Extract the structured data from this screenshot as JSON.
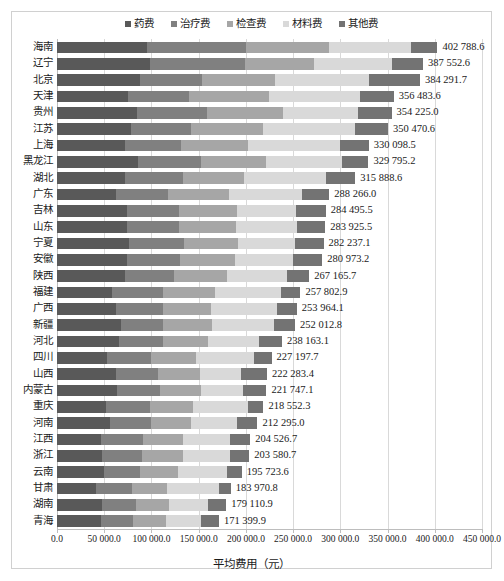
{
  "chart_data": {
    "type": "bar",
    "orientation": "horizontal",
    "stacked": true,
    "title": "",
    "xlabel": "平均费用（元）",
    "ylabel": "",
    "xlim": [
      0,
      450000
    ],
    "xticks": [
      "0.0",
      "50 000.0",
      "100 000.0",
      "150 000.0",
      "200 000.0",
      "250 000.0",
      "300 000.0",
      "350 000.0",
      "400 000.0",
      "450 000.0"
    ],
    "xtick_values": [
      0,
      50000,
      100000,
      150000,
      200000,
      250000,
      300000,
      350000,
      400000,
      450000
    ],
    "grid": true,
    "legend_position": "top",
    "legend": [
      "药费",
      "治疗费",
      "检查费",
      "材料费",
      "其他费"
    ],
    "colors": [
      "#595959",
      "#808080",
      "#a6a6a6",
      "#d9d9d9",
      "#737373"
    ],
    "categories": [
      "海南",
      "辽宁",
      "北京",
      "天津",
      "贵州",
      "江苏",
      "上海",
      "黑龙江",
      "湖北",
      "广东",
      "吉林",
      "山东",
      "宁夏",
      "安徽",
      "陕西",
      "福建",
      "广西",
      "新疆",
      "河北",
      "四川",
      "山西",
      "内蒙古",
      "重庆",
      "河南",
      "江西",
      "浙江",
      "云南",
      "甘肃",
      "湖南",
      "青海"
    ],
    "totals": [
      402788.6,
      387552.6,
      384291.7,
      356483.6,
      354225.0,
      350470.6,
      330098.5,
      329795.2,
      315888.6,
      288266.0,
      284495.5,
      283925.5,
      282237.1,
      280973.2,
      267165.7,
      257802.9,
      253964.1,
      252012.8,
      238163.1,
      227197.7,
      222283.4,
      221747.1,
      218552.3,
      212295.0,
      204526.7,
      203580.7,
      195723.6,
      183970.8,
      179110.9,
      171399.9
    ],
    "total_labels": [
      "402 788.6",
      "387 552.6",
      "384 291.7",
      "356 483.6",
      "354 225.0",
      "350 470.6",
      "330 098.5",
      "329 795.2",
      "315 888.6",
      "288 266.0",
      "284 495.5",
      "283 925.5",
      "282 237.1",
      "280 973.2",
      "267 165.7",
      "257 802.9",
      "253 964.1",
      "252 012.8",
      "238 163.1",
      "227 197.7",
      "222 283.4",
      "221 747.1",
      "218 552.3",
      "212 295.0",
      "204 526.7",
      "203 580.7",
      "195 723.6",
      "183 970.8",
      "179 110.9",
      "171 399.9"
    ],
    "series": [
      {
        "name": "药费",
        "values": [
          95000,
          99000,
          88000,
          75000,
          85000,
          78000,
          72000,
          86000,
          72000,
          62000,
          74000,
          74000,
          76000,
          74000,
          72000,
          58000,
          62000,
          68000,
          66000,
          53000,
          62000,
          63000,
          52000,
          56000,
          47000,
          48000,
          50000,
          41000,
          48000,
          47000
        ]
      },
      {
        "name": "治疗费",
        "values": [
          105000,
          100000,
          66000,
          65000,
          74000,
          64000,
          59000,
          66000,
          61000,
          56000,
          55000,
          55000,
          58000,
          56000,
          52000,
          54000,
          50000,
          44000,
          46000,
          47000,
          45000,
          46000,
          46000,
          44000,
          44000,
          42000,
          38000,
          38000,
          36000,
          34000
        ]
      },
      {
        "name": "检查费",
        "values": [
          88000,
          73000,
          77000,
          84000,
          80000,
          76000,
          71000,
          69000,
          65000,
          64000,
          62000,
          61000,
          58000,
          59000,
          56000,
          55000,
          51000,
          52000,
          48000,
          47000,
          44000,
          44000,
          46000,
          42000,
          42000,
          43000,
          40000,
          38000,
          35000,
          34000
        ]
      },
      {
        "name": "材料费",
        "values": [
          86789,
          82553,
          99292,
          96484,
          80225,
          97471,
          98099,
          80795,
          86889,
          77266,
          62496,
          63926,
          60237,
          60973,
          63166,
          69803,
          69964,
          66013,
          54163,
          61198,
          44283,
          43747,
          58552,
          48295,
          50527,
          50581,
          51724,
          54971,
          41111,
          37400
        ]
      },
      {
        "name": "其他费",
        "values": [
          28000,
          33000,
          54000,
          36000,
          35000,
          35000,
          30000,
          28000,
          31000,
          29000,
          31000,
          30000,
          30000,
          31000,
          24000,
          21000,
          21000,
          22000,
          24000,
          19000,
          27000,
          25000,
          16000,
          22000,
          21000,
          20000,
          16000,
          12000,
          19000,
          19000
        ]
      }
    ]
  }
}
